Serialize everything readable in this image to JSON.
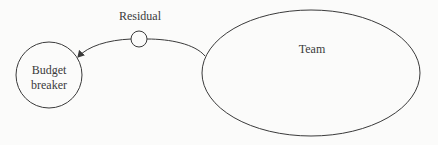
{
  "diagram": {
    "nodes": [
      {
        "id": "budget-breaker",
        "label_lines": [
          "Budget",
          "breaker"
        ],
        "shape": "circle"
      },
      {
        "id": "residual",
        "label": "Residual",
        "shape": "small-circle"
      },
      {
        "id": "team",
        "label": "Team",
        "shape": "ellipse"
      }
    ],
    "edges": [
      {
        "from": "team",
        "to": "budget-breaker",
        "via": "residual",
        "arrow": "end"
      }
    ],
    "colors": {
      "stroke": "#3a3a3a",
      "background": "#fbfbfa"
    }
  }
}
